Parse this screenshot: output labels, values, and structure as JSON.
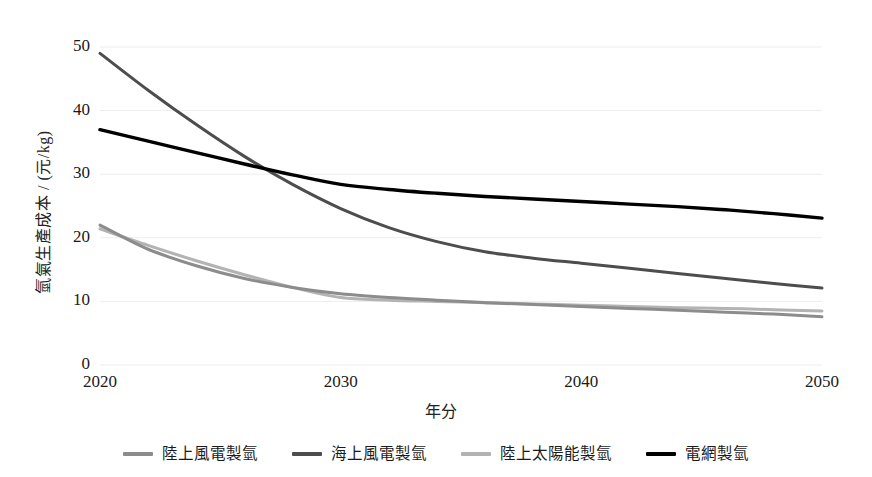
{
  "chart_data": {
    "type": "line",
    "title": "",
    "xlabel": "年分",
    "ylabel": "氫氣生產成本 / (元/kg)",
    "xlim": [
      2020,
      2050
    ],
    "ylim": [
      0,
      50
    ],
    "xticks": [
      "2020",
      "2030",
      "2040",
      "2050"
    ],
    "yticks": [
      "0",
      "10",
      "20",
      "30",
      "40",
      "50"
    ],
    "grid": "horizontal",
    "legend_position": "bottom",
    "x": [
      2020,
      2022,
      2024,
      2026,
      2028,
      2030,
      2032,
      2034,
      2036,
      2038,
      2040,
      2042,
      2044,
      2046,
      2048,
      2050
    ],
    "series": [
      {
        "name": "陸上風電製氫",
        "color": "#8c8c8c",
        "values": [
          22.0,
          18.2,
          15.6,
          13.6,
          12.2,
          11.2,
          10.6,
          10.2,
          9.8,
          9.5,
          9.2,
          8.9,
          8.6,
          8.3,
          8.0,
          7.6
        ]
      },
      {
        "name": "海上風電製氫",
        "color": "#4d4d4d",
        "values": [
          49.0,
          43.2,
          37.8,
          32.8,
          28.4,
          24.6,
          21.6,
          19.4,
          17.8,
          16.8,
          16.0,
          15.2,
          14.4,
          13.6,
          12.8,
          12.1
        ]
      },
      {
        "name": "陸上太陽能製氫",
        "color": "#b3b3b3",
        "values": [
          21.4,
          18.8,
          16.4,
          14.2,
          12.2,
          10.6,
          10.2,
          10.0,
          9.8,
          9.6,
          9.4,
          9.2,
          9.0,
          8.9,
          8.7,
          8.5
        ]
      },
      {
        "name": "電網製氫",
        "color": "#000000",
        "values": [
          37.0,
          35.2,
          33.4,
          31.6,
          29.9,
          28.4,
          27.6,
          27.0,
          26.5,
          26.1,
          25.7,
          25.3,
          24.9,
          24.4,
          23.8,
          23.1
        ]
      }
    ]
  },
  "axis": {
    "y_title": "氫氣生產成本 / (元/kg)",
    "x_title": "年分",
    "y_ticks": [
      "50",
      "40",
      "30",
      "20",
      "10",
      "0"
    ],
    "x_ticks": [
      "2020",
      "2030",
      "2040",
      "2050"
    ]
  },
  "legend": {
    "items": [
      {
        "label": "陸上風電製氫",
        "color": "#8c8c8c"
      },
      {
        "label": "海上風電製氫",
        "color": "#4d4d4d"
      },
      {
        "label": "陸上太陽能製氫",
        "color": "#b3b3b3"
      },
      {
        "label": "電網製氫",
        "color": "#000000"
      }
    ]
  },
  "style": {
    "gridline_color": "#ededed",
    "background": "#ffffff",
    "text_color": "#1a1a1a"
  }
}
